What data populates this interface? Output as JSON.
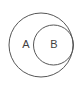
{
  "diagram": {
    "type": "euler-diagram",
    "title": "",
    "background_color": "#ffffff",
    "stroke_color": "#565656",
    "stroke_width": 1,
    "label_color": "#3f3f3f",
    "label_font_size": 11,
    "canvas": {
      "width": 80,
      "height": 90
    },
    "relation": "B is a subset of A",
    "sets": [
      {
        "id": "A",
        "label": "A",
        "shape": "circle",
        "center_x": 41,
        "center_y": 45,
        "radius": 32,
        "label_x": 26,
        "label_y": 44,
        "fill": "none"
      },
      {
        "id": "B",
        "label": "B",
        "shape": "circle",
        "center_x": 53.5,
        "center_y": 45,
        "radius": 20,
        "label_x": 54,
        "label_y": 44,
        "fill": "none"
      }
    ]
  }
}
